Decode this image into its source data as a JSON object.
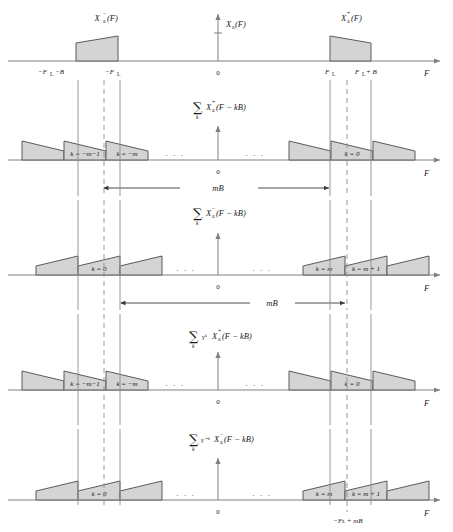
{
  "figure": {
    "type": "signal-spectrum-diagram",
    "axis_label": "F",
    "origin_label": "0",
    "amplitude_tick": "1",
    "ellipsis": "· · ·",
    "colors": {
      "axis": "#808080",
      "outline": "#5a5a5a",
      "fill": "#d4d4d4",
      "guide": "#8c8c8c",
      "text": "#1a1a1a"
    },
    "panels": [
      {
        "id": "panel-1",
        "title_left": "Xₐ⁻(F)",
        "title_center": "Xₐ(F)",
        "title_right": "Xₐ⁺(F)",
        "has_vertical_axis": true,
        "tick_labels": [
          "−Fʟ −B",
          "−Fʟ",
          "0",
          "Fʟ",
          "Fʟ + B",
          "F"
        ],
        "shape_direction_left": "rising",
        "shape_direction_right": "falling"
      },
      {
        "id": "panel-2",
        "summation": "∑",
        "sum_index": "k",
        "expression_base": "X",
        "expression_sub": "a",
        "expression_sup": "+",
        "expression_arg": "(F − kB)",
        "gamma_factor": "",
        "replica_labels": [
          "k = −m−1",
          "k = −m",
          "k = 0"
        ],
        "origin_label": "0",
        "axis_label": "F",
        "span_label": "mB",
        "span_side": "left-to-center",
        "shape_direction": "falling"
      },
      {
        "id": "panel-3",
        "summation": "∑",
        "sum_index": "k",
        "expression_base": "X",
        "expression_sub": "a",
        "expression_sup": "−",
        "expression_arg": "(F − kB)",
        "gamma_factor": "",
        "replica_labels": [
          "k = 0",
          "k = m",
          "k = m + 1"
        ],
        "origin_label": "0",
        "axis_label": "F",
        "span_label": "mB",
        "span_side": "center-to-right",
        "shape_direction": "rising"
      },
      {
        "id": "panel-4",
        "summation": "∑",
        "sum_index": "k",
        "expression_base": "X",
        "expression_sub": "a",
        "expression_sup": "+",
        "expression_arg": "(F − kB)",
        "gamma_factor": "γᵏ",
        "replica_labels": [
          "k = −m−1",
          "k = −m",
          "k = 0"
        ],
        "origin_label": "0",
        "axis_label": "F",
        "span_label": "",
        "shape_direction": "falling"
      },
      {
        "id": "panel-5",
        "summation": "∑",
        "sum_index": "k",
        "expression_base": "X",
        "expression_sub": "a",
        "expression_sup": "−",
        "expression_arg": "(F − kB)",
        "gamma_factor": "γ⁻ᵏ",
        "replica_labels": [
          "k = 0",
          "k = m",
          "k = m + 1"
        ],
        "origin_label": "0",
        "axis_label": "F",
        "bottom_annotation": "−Fʟ + mB",
        "shape_direction": "rising"
      }
    ]
  }
}
